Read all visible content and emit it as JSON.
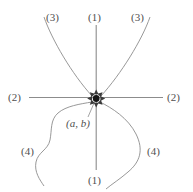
{
  "figure": {
    "type": "phase-portrait-diagram",
    "width": 193,
    "height": 192,
    "background_color": "#ffffff",
    "stroke_color": "#8c8c8c",
    "text_color": "#4f4f4f",
    "equilibrium_point": {
      "label": "(a, b)",
      "x": 96,
      "y": 99,
      "marker": "filled-dot",
      "marker_color": "#1a1a1a",
      "arrow_count": 8,
      "arrow_direction": "inward"
    },
    "labels": {
      "top_left": "(3)",
      "top_center": "(1)",
      "top_right": "(3)",
      "middle_left": "(2)",
      "middle_right": "(2)",
      "bottom_left": "(4)",
      "bottom_right": "(4)",
      "bottom_center": "(1)",
      "point": "(a, b)"
    },
    "curves": [
      {
        "id": "curve-1-vertical",
        "family": "(1)",
        "shape": "straight-vertical"
      },
      {
        "id": "curve-2-horizontal",
        "family": "(2)",
        "shape": "straight-horizontal"
      },
      {
        "id": "curve-3-left",
        "family": "(3)",
        "shape": "upper-left-branch"
      },
      {
        "id": "curve-3-right",
        "family": "(3)",
        "shape": "upper-right-branch"
      },
      {
        "id": "curve-4-left",
        "family": "(4)",
        "shape": "lower-left-s-curve"
      },
      {
        "id": "curve-4-right",
        "family": "(4)",
        "shape": "lower-right-loop"
      }
    ]
  }
}
